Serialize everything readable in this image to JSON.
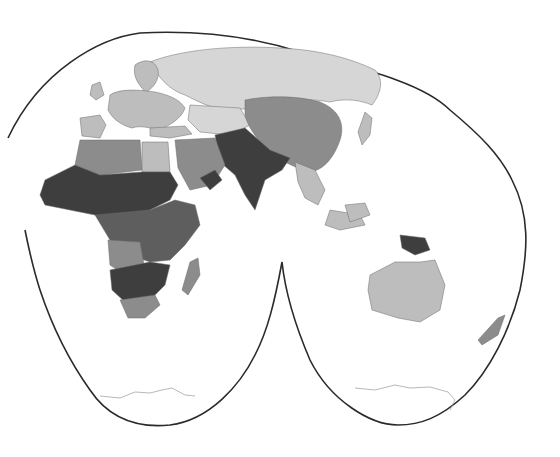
{
  "map": {
    "type": "choropleth",
    "projection": "interrupted (two-lobe, Eastern hemisphere)",
    "title": "",
    "legend": null,
    "colors": {
      "background": "#ffffff",
      "outline": "#2a2a2a",
      "class_1_lightest": "#d6d6d6",
      "class_2_light": "#bdbdbd",
      "class_3_medium": "#8c8c8c",
      "class_4_dark": "#5e5e5e",
      "class_5_darkest": "#3e3e3e"
    },
    "regions": [
      {
        "name": "Russia / Northern Eurasia",
        "class": "class_1_lightest"
      },
      {
        "name": "Western & Central Europe",
        "class": "class_2_light"
      },
      {
        "name": "Iberia",
        "class": "class_2_light"
      },
      {
        "name": "Turkey",
        "class": "class_2_light"
      },
      {
        "name": "Central Asia",
        "class": "class_1_lightest"
      },
      {
        "name": "North Africa (Libya/Algeria)",
        "class": "class_3_medium"
      },
      {
        "name": "Egypt",
        "class": "class_2_light"
      },
      {
        "name": "Middle East / Arabia",
        "class": "class_3_medium"
      },
      {
        "name": "Yemen",
        "class": "class_5_darkest"
      },
      {
        "name": "Sahel & West Africa",
        "class": "class_5_darkest"
      },
      {
        "name": "Central & East Africa",
        "class": "class_4_dark"
      },
      {
        "name": "Angola / DRC south",
        "class": "class_3_medium"
      },
      {
        "name": "Zambia / Zimbabwe / Mozambique",
        "class": "class_5_darkest"
      },
      {
        "name": "South Africa",
        "class": "class_3_medium"
      },
      {
        "name": "Madagascar",
        "class": "class_3_medium"
      },
      {
        "name": "Afghanistan / Pakistan / India",
        "class": "class_5_darkest"
      },
      {
        "name": "China / Mongolia",
        "class": "class_3_medium"
      },
      {
        "name": "Southeast Asia mainland",
        "class": "class_2_light"
      },
      {
        "name": "Indonesia",
        "class": "class_2_light"
      },
      {
        "name": "Papua New Guinea",
        "class": "class_5_darkest"
      },
      {
        "name": "Australia",
        "class": "class_2_light"
      },
      {
        "name": "New Zealand",
        "class": "class_3_medium"
      },
      {
        "name": "Antarctica",
        "class": "outline_only"
      }
    ]
  }
}
